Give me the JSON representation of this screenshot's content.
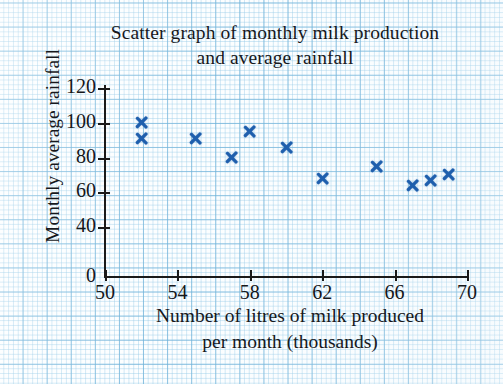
{
  "chart_data": {
    "type": "scatter",
    "title": "Scatter graph of monthly milk production and average rainfall",
    "title_line1": "Scatter graph of monthly milk production",
    "title_line2": "and average rainfall",
    "xlabel": "Number of litres of milk produced per month (thousands)",
    "xlabel_line1": "Number of litres of milk produced",
    "xlabel_line2": "per month (thousands)",
    "ylabel": "Monthly average rainfall",
    "xlim": [
      50,
      70
    ],
    "ylim": [
      0,
      120
    ],
    "xticks": [
      "50",
      "54",
      "58",
      "62",
      "66",
      "70"
    ],
    "yticks": [
      "0",
      "40",
      "60",
      "80",
      "100",
      "120"
    ],
    "y_axis_note": "axis compressed between 0 and 40",
    "grid": "graph paper background, no plotted gridlines",
    "legend": "none",
    "marker": "x-cross",
    "marker_color": "#1f5fad",
    "points": [
      {
        "x": 52,
        "y": 100
      },
      {
        "x": 52,
        "y": 91
      },
      {
        "x": 55,
        "y": 91
      },
      {
        "x": 57,
        "y": 80
      },
      {
        "x": 58,
        "y": 95
      },
      {
        "x": 60,
        "y": 86
      },
      {
        "x": 62,
        "y": 68
      },
      {
        "x": 65,
        "y": 75
      },
      {
        "x": 67,
        "y": 64
      },
      {
        "x": 68,
        "y": 67
      },
      {
        "x": 69,
        "y": 70
      }
    ]
  },
  "colors": {
    "marker": "#1f5fad",
    "axis": "#1a1a1a",
    "text": "#16181c",
    "grid_major": "#6cb0d8",
    "grid_minor": "#96cae8",
    "paper": "#fcfeff"
  }
}
